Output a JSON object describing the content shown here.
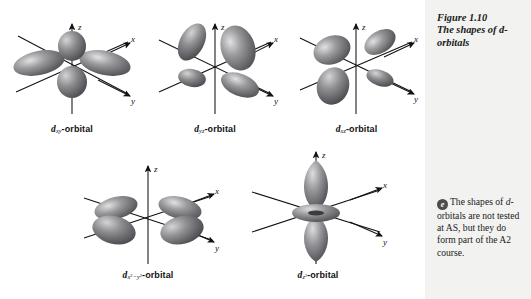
{
  "figure": {
    "caption_number": "Figure 1.10",
    "caption_text": "The shapes of d-orbitals"
  },
  "note": {
    "icon": "e-resource-icon",
    "icon_glyph": "e",
    "text_line1": "The shapes of",
    "text_line2_italic": "d",
    "text_line2_rest": "-orbitals are not",
    "text_line3": "tested at AS, but",
    "text_line4": "they do form part",
    "text_line5": "of the A2 course.",
    "full_text": "The shapes of d-orbitals are not tested at AS, but they do form part of the A2 course."
  },
  "axes": {
    "z": "z",
    "x": "x",
    "y": "y"
  },
  "orbitals": [
    {
      "id": "dxy",
      "d": "d",
      "subscript": "xy",
      "suffix": "-orbital",
      "label_plain": "dxy-orbital",
      "shape": "four-lobe-clover",
      "lobe_count": 4
    },
    {
      "id": "dyz",
      "d": "d",
      "subscript": "yz",
      "suffix": "-orbital",
      "label_plain": "dyz-orbital",
      "shape": "four-lobe-clover",
      "lobe_count": 4
    },
    {
      "id": "dxz",
      "d": "d",
      "subscript": "xz",
      "suffix": "-orbital",
      "label_plain": "dxz-orbital",
      "shape": "four-lobe-clover",
      "lobe_count": 4
    },
    {
      "id": "dx2-y2",
      "d": "d",
      "subscript_x": "x",
      "subscript_sup1": "2",
      "subscript_minus": "−",
      "subscript_y": "y",
      "subscript_sup2": "2",
      "suffix": "-orbital",
      "label_plain": "dx2-y2-orbital",
      "shape": "four-lobe-clover-axial",
      "lobe_count": 4
    },
    {
      "id": "dz2",
      "d": "d",
      "subscript_z": "z",
      "subscript_sup": "2",
      "suffix": "-orbital",
      "label_plain": "dz2-orbital",
      "shape": "two-lobe-with-torus",
      "lobe_count": 2
    }
  ],
  "colors": {
    "lobe_dark": "#58585a",
    "lobe_mid": "#8c8c8e",
    "lobe_light": "#d2d2d4",
    "axis": "#121212",
    "sidebar_bg": "#f2f2f0",
    "text": "#1a1a1a",
    "badge_bg": "#4d4d4d"
  }
}
